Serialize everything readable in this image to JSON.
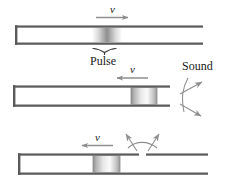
{
  "figure": {
    "colors": {
      "tube_wall": "#6e6e6e",
      "tube_wall_dark": "#4a4a4a",
      "arrow": "#8a8a8a",
      "text": "#1a1a1a",
      "pulse_light": "#ffffff",
      "pulse_dark": "#9a9a9a",
      "block_light": "#f2f2f2",
      "block_dark": "#a8a8a8"
    },
    "panels": [
      {
        "id": "panel-1",
        "velocity_label": "v",
        "velocity_direction": "right",
        "pulse_label": "Pulse",
        "pulse_kind": "diffuse-gradient",
        "tube_closed_end": "left",
        "tube_open_end": "right",
        "has_brace": true,
        "sound_emitted": false
      },
      {
        "id": "panel-2",
        "velocity_label": "v",
        "velocity_direction": "left",
        "pulse_label": "",
        "pulse_kind": "solid-block",
        "tube_closed_end": "left",
        "tube_open_end": "right",
        "has_brace": false,
        "sound_emitted": true,
        "sound_label": "Sound",
        "sound_location": "right-end"
      },
      {
        "id": "panel-3",
        "velocity_label": "v",
        "velocity_direction": "left",
        "pulse_label": "",
        "pulse_kind": "solid-block",
        "tube_closed_end": "left",
        "tube_open_end": "right",
        "has_brace": false,
        "sound_emitted": true,
        "sound_label": "",
        "sound_location": "top-gap",
        "has_top_gap": true
      }
    ],
    "labels": {
      "v1": "v",
      "v2": "v",
      "v3": "v",
      "pulse": "Pulse",
      "sound": "Sound"
    }
  }
}
